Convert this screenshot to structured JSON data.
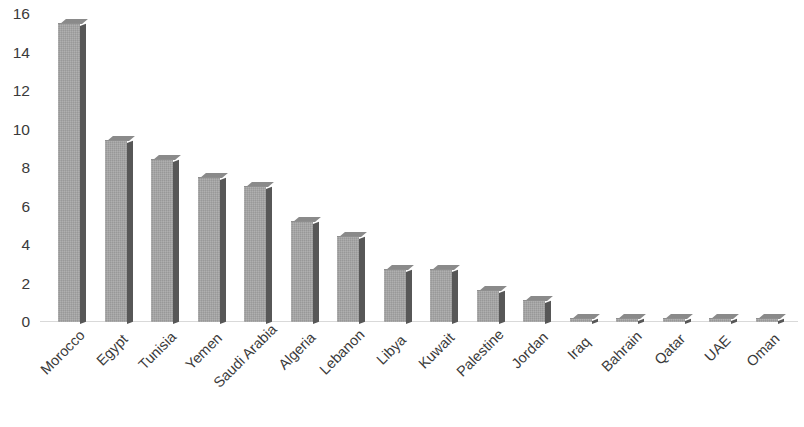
{
  "chart_data": {
    "type": "bar",
    "title": "",
    "subtitle": "",
    "xlabel": "",
    "ylabel": "",
    "categories": [
      "Morocco",
      "Egypt",
      "Tunisia",
      "Yemen",
      "Saudi Arabia",
      "Algeria",
      "Lebanon",
      "Libya",
      "Kuwait",
      "Palestine",
      "Jordan",
      "Iraq",
      "Bahrain",
      "Qatar",
      "UAE",
      "Oman"
    ],
    "values": [
      15.5,
      9.4,
      8.4,
      7.5,
      7.0,
      5.2,
      4.4,
      2.7,
      2.7,
      1.6,
      1.1,
      0.1,
      0.1,
      0.1,
      0.1,
      0.1
    ],
    "ylim": [
      0,
      16
    ],
    "ytick_labels": [
      "16",
      "14",
      "12",
      "10",
      "8",
      "6",
      "4",
      "2",
      "0"
    ],
    "ytick_values": [
      16,
      14,
      12,
      10,
      8,
      6,
      4,
      2,
      0
    ],
    "grid": false,
    "legend": null,
    "legend_position": "none",
    "annotations": [],
    "bar_color": "#a6a6a6",
    "bar_shadow_color": "#575757",
    "axis_text_color": "#3a3a3a",
    "baseline_color": "#d9d9d9",
    "background_color": "#ffffff",
    "label_rotation_degrees": -45
  }
}
